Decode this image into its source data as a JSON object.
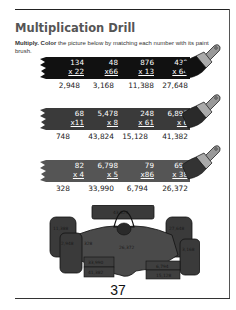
{
  "page": {
    "title": "Multiplication Drill",
    "instructions": {
      "bold1": "Multiply.",
      "bold2": "Color",
      "text": " the picture below by matching each number with its paint brush."
    },
    "page_number": "37"
  },
  "rows": [
    {
      "band_color": "#111111",
      "problems": [
        {
          "top": "134",
          "bottom": "x  22",
          "answer": "2,948"
        },
        {
          "top": "48",
          "bottom": "x66",
          "answer": "3,168"
        },
        {
          "top": "876",
          "bottom": "x  13",
          "answer": "11,388"
        },
        {
          "top": "432",
          "bottom": "x  64",
          "answer": "27,648"
        }
      ]
    },
    {
      "band_color": "#3a3a3a",
      "problems": [
        {
          "top": "68",
          "bottom": "x11",
          "answer": "748"
        },
        {
          "top": "5,478",
          "bottom": "x     8",
          "answer": "43,824"
        },
        {
          "top": "248",
          "bottom": "x  61",
          "answer": "15,128"
        },
        {
          "top": "6,897",
          "bottom": "x     6",
          "answer": "41,382"
        }
      ]
    },
    {
      "band_color": "#555555",
      "problems": [
        {
          "top": "82",
          "bottom": "x  4",
          "answer": "328"
        },
        {
          "top": "6,798",
          "bottom": "x     5",
          "answer": "33,990"
        },
        {
          "top": "79",
          "bottom": "x86",
          "answer": "6,794"
        },
        {
          "top": "694",
          "bottom": "x  38",
          "answer": "26,372"
        }
      ]
    }
  ],
  "car": {
    "labels": {
      "wing": "43,824",
      "left_rear_tire": "11,388",
      "right_rear_tire": "27,648",
      "left_front_tire": "2,948",
      "left_side": "328",
      "body_center": "26,372",
      "right_front_tire": "3,168",
      "left_pod_upper": "33,990",
      "left_pod_lower": "41,382",
      "right_pod_upper": "6,794",
      "right_pod_lower": "15,128"
    }
  }
}
